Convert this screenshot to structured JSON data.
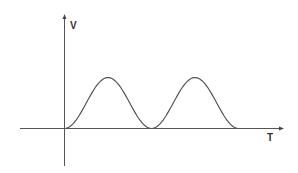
{
  "chart_data": {
    "type": "line",
    "title": "",
    "xlabel": "T",
    "ylabel": "V",
    "grid": false,
    "legend": null,
    "series": [
      {
        "name": "V(T)",
        "x": [
          0,
          0.25,
          0.5,
          0.75,
          1.0,
          1.25,
          1.5,
          1.75,
          2.0
        ],
        "values": [
          0,
          0.5,
          1.0,
          0.5,
          0,
          0.5,
          1.0,
          0.5,
          0
        ]
      }
    ],
    "pulses": [
      {
        "start_x": 0.0,
        "peak_x": 0.5,
        "end_x": 1.0,
        "peak_value": 1.0
      },
      {
        "start_x": 1.0,
        "peak_x": 1.5,
        "end_x": 2.0,
        "peak_value": 1.0
      }
    ],
    "axes": {
      "x_arrow": true,
      "y_arrow": true
    }
  },
  "labels": {
    "y_axis": "V",
    "x_axis": "T"
  }
}
